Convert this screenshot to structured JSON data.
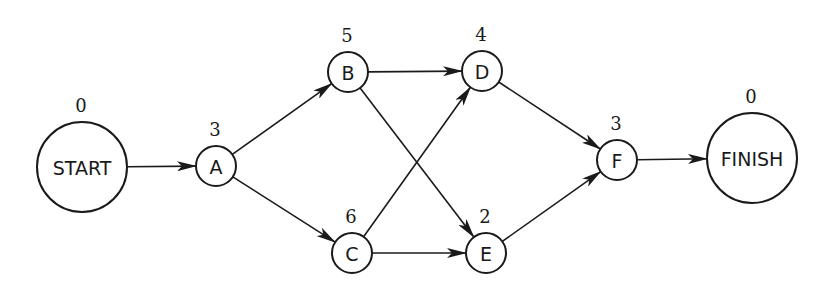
{
  "diagram": {
    "type": "activity-on-node network",
    "nodes": [
      {
        "id": "START",
        "label": "START",
        "duration": "0",
        "cx": 82,
        "cy": 167,
        "r": 45,
        "size": "large"
      },
      {
        "id": "A",
        "label": "A",
        "duration": "3",
        "cx": 216,
        "cy": 166,
        "r": 20,
        "size": "small"
      },
      {
        "id": "B",
        "label": "B",
        "duration": "5",
        "cx": 348,
        "cy": 72,
        "r": 20,
        "size": "small"
      },
      {
        "id": "C",
        "label": "C",
        "duration": "6",
        "cx": 352,
        "cy": 253,
        "r": 20,
        "size": "small"
      },
      {
        "id": "D",
        "label": "D",
        "duration": "4",
        "cx": 482,
        "cy": 71,
        "r": 20,
        "size": "small"
      },
      {
        "id": "E",
        "label": "E",
        "duration": "2",
        "cx": 486,
        "cy": 253,
        "r": 20,
        "size": "small"
      },
      {
        "id": "F",
        "label": "F",
        "duration": "3",
        "cx": 617,
        "cy": 160,
        "r": 20,
        "size": "small"
      },
      {
        "id": "FINISH",
        "label": "FINISH",
        "duration": "0",
        "cx": 752,
        "cy": 158,
        "r": 45,
        "size": "large"
      }
    ],
    "edges": [
      {
        "from": "START",
        "to": "A"
      },
      {
        "from": "A",
        "to": "B"
      },
      {
        "from": "A",
        "to": "C"
      },
      {
        "from": "B",
        "to": "D"
      },
      {
        "from": "B",
        "to": "E"
      },
      {
        "from": "C",
        "to": "D"
      },
      {
        "from": "C",
        "to": "E"
      },
      {
        "from": "D",
        "to": "F"
      },
      {
        "from": "E",
        "to": "F"
      },
      {
        "from": "F",
        "to": "FINISH"
      }
    ],
    "colors": {
      "stroke": "#1a1a1a",
      "background": "#ffffff"
    }
  }
}
